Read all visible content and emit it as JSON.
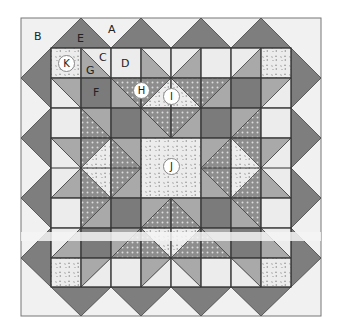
{
  "diagram": {
    "type": "quilt block layout",
    "colors": {
      "background_light": "#f1f1f1",
      "light": "#ececec",
      "medium": "#a9a9a9",
      "dark": "#7b7b7b",
      "border_triangle": "#7e7e7e",
      "outline": "#444444",
      "dots_fill": "#8e8e8e",
      "floral_fill": "#e6e6e6"
    },
    "labels": {
      "A": "A",
      "B": "B",
      "C": "C",
      "D": "D",
      "E": "E",
      "F": "F",
      "G": "G",
      "H": "H",
      "I": "I",
      "J": "J",
      "K": "K"
    }
  }
}
